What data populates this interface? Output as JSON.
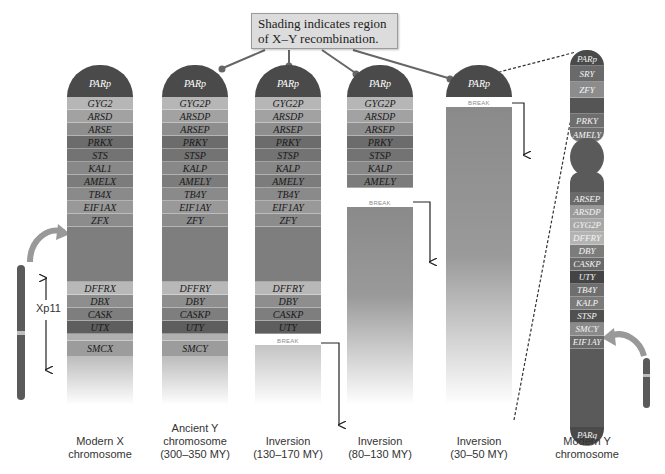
{
  "callout": {
    "line1": "Shading indicates region",
    "line2": "of X–Y recombination."
  },
  "colors": {
    "cap": "#4a4a4a",
    "dark": "#5c5c5c",
    "mid": "#7a7a7a",
    "light": "#a8a8a8",
    "lighter": "#b8b8b8",
    "ybody": "#5a5a5a"
  },
  "columns": [
    {
      "id": "modern-x",
      "caption": [
        "Modern X",
        "chromosome"
      ],
      "cap": "PARp",
      "top_bands": [
        "GYG2",
        "ARSD",
        "ARSE",
        "PRKX",
        "STS",
        "KAL1",
        "AMELX",
        "TB4X",
        "EIF1AX",
        "ZFX"
      ],
      "bottom_bands": [
        "DFFRX",
        "DBX",
        "CASK",
        "UTX",
        "SMCX"
      ],
      "side_label": "Xp11"
    },
    {
      "id": "ancient-y",
      "caption": [
        "Ancient Y",
        "chromosome",
        "(300–350 MY)"
      ],
      "cap": "PARp",
      "top_bands": [
        "GYG2P",
        "ARSDP",
        "ARSEP",
        "PRKY",
        "STSP",
        "KALP",
        "AMELY",
        "TB4Y",
        "EIF1AY",
        "ZFY"
      ],
      "bottom_bands": [
        "DFFRY",
        "DBY",
        "CASKP",
        "UTY",
        "SMCY"
      ]
    },
    {
      "id": "inversion-1",
      "caption": [
        "Inversion",
        "(130–170 MY)"
      ],
      "cap": "PARp",
      "top_bands": [
        "GYG2P",
        "ARSDP",
        "ARSEP",
        "PRKY",
        "STSP",
        "KALP",
        "AMELY",
        "TB4Y",
        "EIF1AY",
        "ZFY"
      ],
      "bottom_bands": [
        "DFFRY",
        "DBY",
        "CASKP",
        "UTY"
      ],
      "break_label": "BREAK"
    },
    {
      "id": "inversion-2",
      "caption": [
        "Inversion",
        "(80–130 MY)"
      ],
      "cap": "PARp",
      "top_bands": [
        "GYG2P",
        "ARSDP",
        "ARSEP",
        "PRKY",
        "STSP",
        "KALP",
        "AMELY"
      ],
      "break_label": "BREAK"
    },
    {
      "id": "inversion-3",
      "caption": [
        "Inversion",
        "(30–50 MY)"
      ],
      "cap": "PARp",
      "break_label": "BREAK"
    }
  ],
  "modern_y": {
    "caption": [
      "Modern Y",
      "chromosome"
    ],
    "top_cap": "PARp",
    "p_arm": [
      "SRY",
      "ZFY",
      "",
      "PRKY",
      "AMELY"
    ],
    "q_arm": [
      "ARSEP",
      "ARSDP",
      "GYG2P",
      "DFFRY",
      "DBY",
      "CASKP",
      "UTY",
      "TB4Y",
      "KALP",
      "STSP",
      "SMCY",
      "EIF1AY"
    ],
    "bottom_cap": "PARq"
  }
}
